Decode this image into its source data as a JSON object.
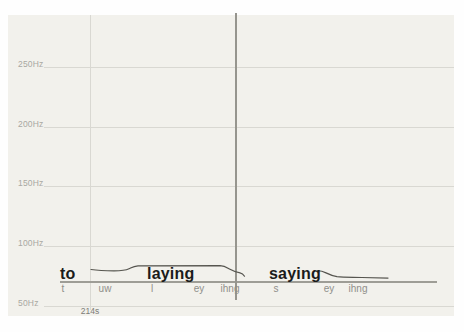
{
  "colors": {
    "page_bg": "#fefefe",
    "plot_bg": "#f2f1ec",
    "grid": "#d9d8d2",
    "cursor": "#96958e",
    "baseline": "#9e9d96",
    "contour": "#56554f",
    "tick_label": "#a9a8a2",
    "time_label": "#7d7c77",
    "word": "#1b1b1a",
    "phoneme": "#908f8a"
  },
  "y_axis": {
    "unit": "Hz",
    "ticks": [
      {
        "label": "250Hz",
        "y": 68
      },
      {
        "label": "200Hz",
        "y": 128
      },
      {
        "label": "150Hz",
        "y": 187
      },
      {
        "label": "100Hz",
        "y": 247
      },
      {
        "label": "50Hz",
        "y": 307
      }
    ]
  },
  "x_axis": {
    "tick_label": "214s",
    "tick_x": 90,
    "tick_label_y": 307
  },
  "vertical_gridline": {
    "x": 90,
    "y1": 15,
    "y2": 310
  },
  "cursor": {
    "x": 235,
    "y1": 13,
    "y2": 300
  },
  "baseline": {
    "y": 281,
    "x1": 60,
    "x2": 437
  },
  "words": [
    {
      "text": "to",
      "x": 60,
      "y": 266
    },
    {
      "text": "laying",
      "x": 147,
      "y": 266
    },
    {
      "text": "saying",
      "x": 269,
      "y": 266
    }
  ],
  "phonemes": [
    {
      "text": "t",
      "x": 63,
      "y": 284
    },
    {
      "text": "uw",
      "x": 105,
      "y": 284
    },
    {
      "text": "l",
      "x": 152,
      "y": 284
    },
    {
      "text": "ey",
      "x": 199,
      "y": 284
    },
    {
      "text": "ihng",
      "x": 230,
      "y": 284
    },
    {
      "text": "s",
      "x": 276,
      "y": 284
    },
    {
      "text": "ey",
      "x": 329,
      "y": 284
    },
    {
      "text": "ihng",
      "x": 358,
      "y": 284
    }
  ],
  "contour_segments_px": [
    "M91,269.5 C98,270.6 106,270.9 114,270.9 C121,270.9 126,270.3 129,268.8 C132,267.4 133.5,266.2 138,265.9 L220,265.6 C225,265.8 227,267.6 230,269.3 C233,271 236,272.2 240,272.9 C242.2,273.3 243.5,274.6 244.5,276.2",
    "M317,270.8 C321,270.4 323,271.4 326,272.9 C329,274.4 332,275.9 337,276.6 C344,277.4 352,277.2 362,277.5 L388,278.1"
  ],
  "chart_data": {
    "type": "line",
    "title": "",
    "xlabel": "time",
    "ylabel": "frequency (Hz)",
    "y_tick_values_hz": [
      250,
      200,
      150,
      100,
      50
    ],
    "x_tick_labels": [
      "214s"
    ],
    "grid": true,
    "cursor_present": true,
    "series": [
      {
        "name": "pitch contour (to laying)",
        "points_xpx_hz": [
          [
            91,
            81.3
          ],
          [
            114,
            80.1
          ],
          [
            129,
            81.8
          ],
          [
            138,
            84.3
          ],
          [
            220,
            84.5
          ],
          [
            230,
            81.4
          ],
          [
            240,
            78.4
          ],
          [
            244,
            76.0
          ]
        ]
      },
      {
        "name": "pitch contour (saying)",
        "points_xpx_hz": [
          [
            317,
            80.2
          ],
          [
            326,
            78.4
          ],
          [
            337,
            75.3
          ],
          [
            362,
            74.6
          ],
          [
            388,
            74.1
          ]
        ]
      }
    ],
    "annotations": {
      "words": [
        "to",
        "laying",
        "saying"
      ],
      "phones": [
        "t",
        "uw",
        "l",
        "ey",
        "ihng",
        "s",
        "ey",
        "ihng"
      ]
    }
  }
}
